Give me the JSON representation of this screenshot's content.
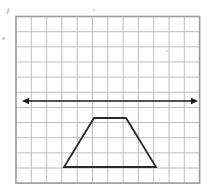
{
  "figure": {
    "background_color": "#ffffff",
    "grid": {
      "name": "square-grid",
      "columns": 12,
      "rows": 11,
      "left": 16,
      "top": 16.5,
      "cell_width": 15.3,
      "cell_height": 15.15,
      "line_color": "#b5b7bb",
      "line_width": 0.9,
      "border_color": "#9a9ca0",
      "border_width": 1.6
    },
    "line": {
      "name": "horizontal-double-arrow-line",
      "label": "line of reflection",
      "color": "#1a1a1a",
      "stroke_width": 1.7,
      "y": 101,
      "x_start": 22,
      "x_end": 198,
      "arrowheads": "both",
      "arrow_size": 7
    },
    "trapezoid": {
      "name": "trapezoid-shape",
      "color": "#2a2a2a",
      "stroke_width": 1.8,
      "fill": "none",
      "vertices": [
        {
          "label": "top-left",
          "x": 94,
          "y": 118
        },
        {
          "label": "top-right",
          "x": 126,
          "y": 118
        },
        {
          "label": "bottom-right",
          "x": 156,
          "y": 167
        },
        {
          "label": "bottom-left",
          "x": 64,
          "y": 167
        }
      ]
    },
    "specks": [
      {
        "name": "speck-top-left-tick",
        "x": 7,
        "y": 8,
        "w": 2,
        "h": 6,
        "rot": 22,
        "color": "#c9c9c9"
      },
      {
        "name": "speck-left-dot",
        "x": 2,
        "y": 37,
        "w": 3,
        "h": 3,
        "rot": 0,
        "color": "#c2c2c2"
      },
      {
        "name": "speck-top-dot",
        "x": 93,
        "y": 9,
        "w": 2,
        "h": 2,
        "rot": 0,
        "color": "#d2d2d2"
      },
      {
        "name": "speck-inner-dot",
        "x": 166,
        "y": 50,
        "w": 2,
        "h": 2,
        "rot": 0,
        "color": "#d4d4d4"
      },
      {
        "name": "speck-bottom-dot",
        "x": 16,
        "y": 179,
        "w": 2,
        "h": 2,
        "rot": 0,
        "color": "#d8d8d8"
      }
    ]
  }
}
